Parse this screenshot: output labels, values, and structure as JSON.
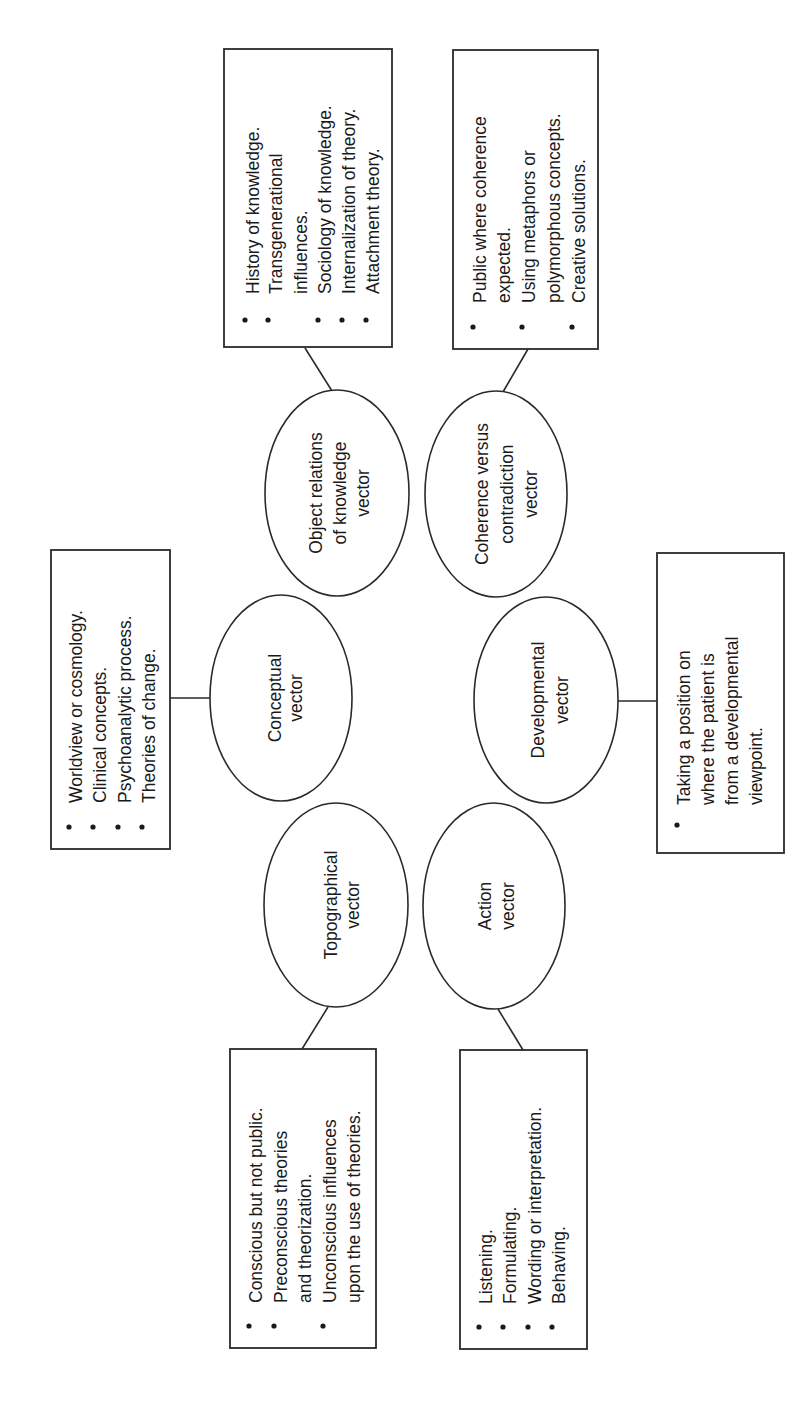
{
  "diagram": {
    "orientation": "rotated -90 degrees (text reads bottom to top)",
    "nodes": {
      "object_relations": {
        "lines": [
          "Object relations",
          "of knowledge",
          "vector"
        ]
      },
      "coherence": {
        "lines": [
          "Coherence versus",
          "contradiction",
          "vector"
        ]
      },
      "conceptual": {
        "lines": [
          "Conceptual",
          "vector"
        ]
      },
      "developmental": {
        "lines": [
          "Developmental",
          "vector"
        ]
      },
      "topographical": {
        "lines": [
          "Topographical",
          "vector"
        ]
      },
      "action": {
        "lines": [
          "Action",
          "vector"
        ]
      }
    },
    "boxes": {
      "object_relations": {
        "items": [
          [
            "History of knowledge."
          ],
          [
            "Transgenerational",
            "influences."
          ],
          [
            "Sociology of knowledge."
          ],
          [
            "Internalization of theory."
          ],
          [
            "Attachment theory."
          ]
        ]
      },
      "coherence": {
        "items": [
          [
            "Public where coherence",
            "expected."
          ],
          [
            "Using metaphors or",
            "polymorphous concepts."
          ],
          [
            "Creative solutions."
          ]
        ]
      },
      "conceptual": {
        "items": [
          [
            "Worldview or cosmology."
          ],
          [
            "Clinical concepts."
          ],
          [
            "Psychoanalytic process."
          ],
          [
            "Theories of change."
          ]
        ]
      },
      "developmental": {
        "items": [
          [
            "Taking a position on",
            "where the patient is",
            "from a developmental",
            "viewpoint."
          ]
        ]
      },
      "topographical": {
        "items": [
          [
            "Conscious but not public."
          ],
          [
            "Preconscious theories",
            "and theorization."
          ],
          [
            "Unconscious influences",
            "upon the use of theories."
          ]
        ]
      },
      "action": {
        "items": [
          [
            "Listening."
          ],
          [
            "Formulating."
          ],
          [
            "Wording or interpretation."
          ],
          [
            "Behaving."
          ]
        ]
      }
    }
  }
}
